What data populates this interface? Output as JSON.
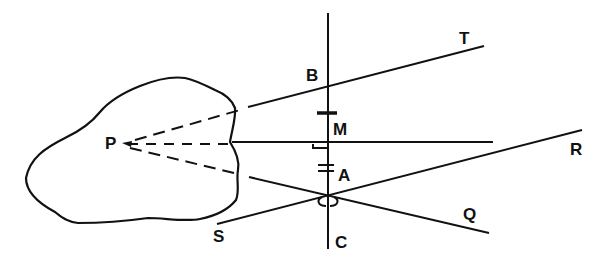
{
  "diagram": {
    "type": "geometry-construction",
    "labels": {
      "P": "P",
      "B": "B",
      "M": "M",
      "A": "A",
      "C": "C",
      "T": "T",
      "R": "R",
      "Q": "Q",
      "S": "S"
    },
    "stroke_color": "#111111",
    "background": "#ffffff"
  }
}
